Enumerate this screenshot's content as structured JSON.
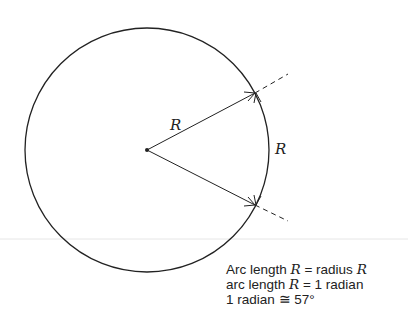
{
  "diagram": {
    "labels": {
      "radius_label": "R",
      "arc_label": "R"
    },
    "caption": {
      "line1": {
        "prefix": "Arc length ",
        "var1": "R",
        "middle": " = radius ",
        "var2": "R"
      },
      "line2": {
        "prefix": "arc length ",
        "var1": "R",
        "suffix": " = 1 radian"
      },
      "line3": {
        "text": "1 radian ≅ 57°"
      }
    },
    "colors": {
      "stroke": "#222222",
      "background": "#ffffff"
    }
  }
}
